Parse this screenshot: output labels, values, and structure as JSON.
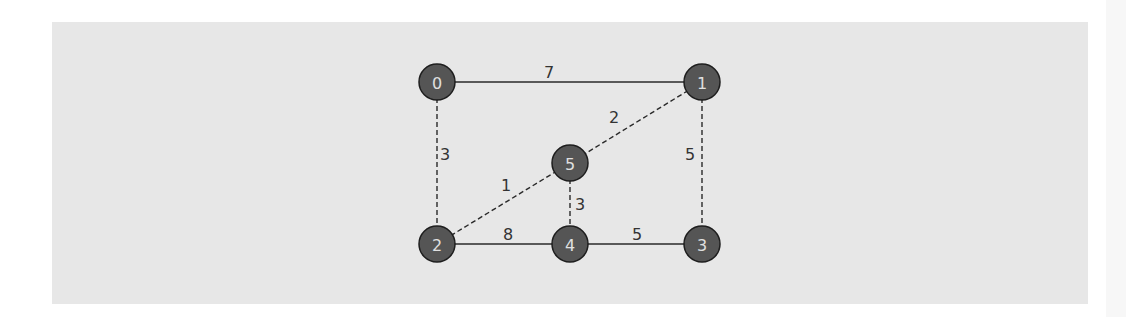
{
  "diagram": {
    "type": "weighted-undirected-graph",
    "colors": {
      "panel_background": "#e7e7e7",
      "node_fill": "#555555",
      "node_stroke": "#1e1e1e",
      "node_text": "#e0e0e0",
      "edge": "#2a2a2a",
      "edge_label": "#333333"
    },
    "nodes": [
      {
        "id": "0",
        "label": "0",
        "x": 437,
        "y": 82
      },
      {
        "id": "1",
        "label": "1",
        "x": 702,
        "y": 82
      },
      {
        "id": "2",
        "label": "2",
        "x": 437,
        "y": 244
      },
      {
        "id": "3",
        "label": "3",
        "x": 702,
        "y": 244
      },
      {
        "id": "4",
        "label": "4",
        "x": 570,
        "y": 244
      },
      {
        "id": "5",
        "label": "5",
        "x": 570,
        "y": 163
      }
    ],
    "edges": [
      {
        "from": "0",
        "to": "1",
        "weight": "7",
        "style": "solid",
        "label_x": 549,
        "label_y": 72
      },
      {
        "from": "0",
        "to": "2",
        "weight": "3",
        "style": "dashed",
        "label_x": 445,
        "label_y": 154
      },
      {
        "from": "1",
        "to": "5",
        "weight": "2",
        "style": "dashed",
        "label_x": 614,
        "label_y": 117
      },
      {
        "from": "1",
        "to": "3",
        "weight": "5",
        "style": "dashed",
        "label_x": 690,
        "label_y": 154
      },
      {
        "from": "2",
        "to": "5",
        "weight": "1",
        "style": "dashed",
        "label_x": 506,
        "label_y": 185
      },
      {
        "from": "5",
        "to": "4",
        "weight": "3",
        "style": "dashed",
        "label_x": 580,
        "label_y": 204
      },
      {
        "from": "2",
        "to": "4",
        "weight": "8",
        "style": "solid",
        "label_x": 508,
        "label_y": 234
      },
      {
        "from": "4",
        "to": "3",
        "weight": "5",
        "style": "solid",
        "label_x": 637,
        "label_y": 234
      }
    ]
  }
}
